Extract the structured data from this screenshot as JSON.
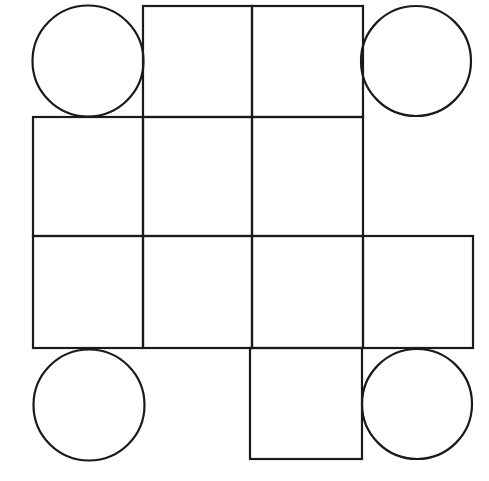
{
  "figure": {
    "canvas": {
      "width": 489,
      "height": 481,
      "background_color": "#ffffff"
    },
    "style": {
      "stroke_color": "#1a1a1a",
      "stroke_width": 2.2,
      "fill_color": "none"
    },
    "grid": {
      "x_lines": [
        33,
        143,
        252,
        363,
        473
      ],
      "y_lines": [
        6,
        117,
        236,
        348,
        459
      ],
      "cell_width": 110,
      "cell_height": 111
    },
    "squares": [
      {
        "name": "top-left-inner-square",
        "x": 143,
        "y": 6,
        "w": 109,
        "h": 111
      },
      {
        "name": "top-right-inner-square",
        "x": 252,
        "y": 6,
        "w": 111,
        "h": 111
      },
      {
        "name": "middle-row-left-square",
        "x": 33,
        "y": 117,
        "w": 110,
        "h": 119
      },
      {
        "name": "middle-row-center-square",
        "x": 143,
        "y": 117,
        "w": 109,
        "h": 119
      },
      {
        "name": "middle-row-right-square",
        "x": 252,
        "y": 117,
        "w": 111,
        "h": 119
      },
      {
        "name": "third-row-left-square",
        "x": 33,
        "y": 236,
        "w": 110,
        "h": 112
      },
      {
        "name": "third-row-center-square",
        "x": 143,
        "y": 236,
        "w": 109,
        "h": 112
      },
      {
        "name": "third-row-right-square",
        "x": 252,
        "y": 236,
        "w": 111,
        "h": 112
      },
      {
        "name": "right-flap-square",
        "x": 363,
        "y": 236,
        "w": 110,
        "h": 112
      },
      {
        "name": "bottom-flap-square",
        "x": 250,
        "y": 348,
        "w": 112,
        "h": 111
      }
    ],
    "circles": [
      {
        "name": "top-left-circle",
        "cx": 88,
        "cy": 61,
        "r": 55.5
      },
      {
        "name": "top-right-circle",
        "cx": 416,
        "cy": 61,
        "r": 55.0
      },
      {
        "name": "bottom-left-circle",
        "cx": 89,
        "cy": 405,
        "r": 55.5
      },
      {
        "name": "bottom-right-circle",
        "cx": 417,
        "cy": 404,
        "r": 55.0
      }
    ],
    "counts": {
      "squares_label": "10",
      "circles_label": "4"
    }
  }
}
